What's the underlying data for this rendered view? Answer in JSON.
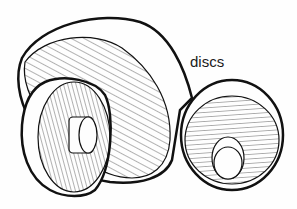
{
  "figure": {
    "label": "discs",
    "colors": {
      "stroke": "#111111",
      "background": "#fefefe"
    }
  }
}
